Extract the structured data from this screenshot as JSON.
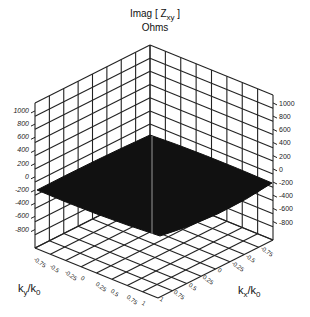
{
  "chart_data": {
    "type": "surface3d",
    "title_line1": "Imag [ Z",
    "title_sub": "xy",
    "title_line1_end": " ]",
    "title_line2": "Ohms",
    "zlabel": "Imag [ Zxy ] Ohms",
    "xlabel": "kx/k0",
    "ylabel": "ky/k0",
    "z_ticks": [
      "1000",
      "800",
      "600",
      "400",
      "200",
      "0",
      "-200",
      "-400",
      "-600",
      "-800"
    ],
    "zlim": [
      -900,
      1000
    ],
    "y_ticks": [
      "-0.75",
      "-0.5",
      "-0.25",
      "0",
      "0.25",
      "0.5",
      "0.75",
      "1"
    ],
    "x_ticks": [
      "-0.75",
      "-0.5",
      "-0.25",
      "0",
      "0.25",
      "0.5",
      "0.75",
      "1"
    ],
    "xlim": [
      -1,
      1
    ],
    "ylim": [
      -1,
      1
    ],
    "surface_description": "Solid black surface, peaked near (kx,ky)=(-1,-1) back corner at ~ +150 Ohms, edges near -200 Ohms at left/right corners, sagging to ~ -400 Ohms at front corner (1,1)",
    "surface_corner_values": {
      "back": 150,
      "left": -200,
      "right": -200,
      "front": -420
    },
    "grid": true,
    "surface_color": "#111111"
  },
  "labels": {
    "xaxis_k": "k",
    "xaxis_sub": "x",
    "xaxis_k0": "/k",
    "xaxis_k0_sub": "0",
    "yaxis_k": "k",
    "yaxis_sub": "y",
    "yaxis_k0": "/k",
    "yaxis_k0_sub": "0"
  }
}
